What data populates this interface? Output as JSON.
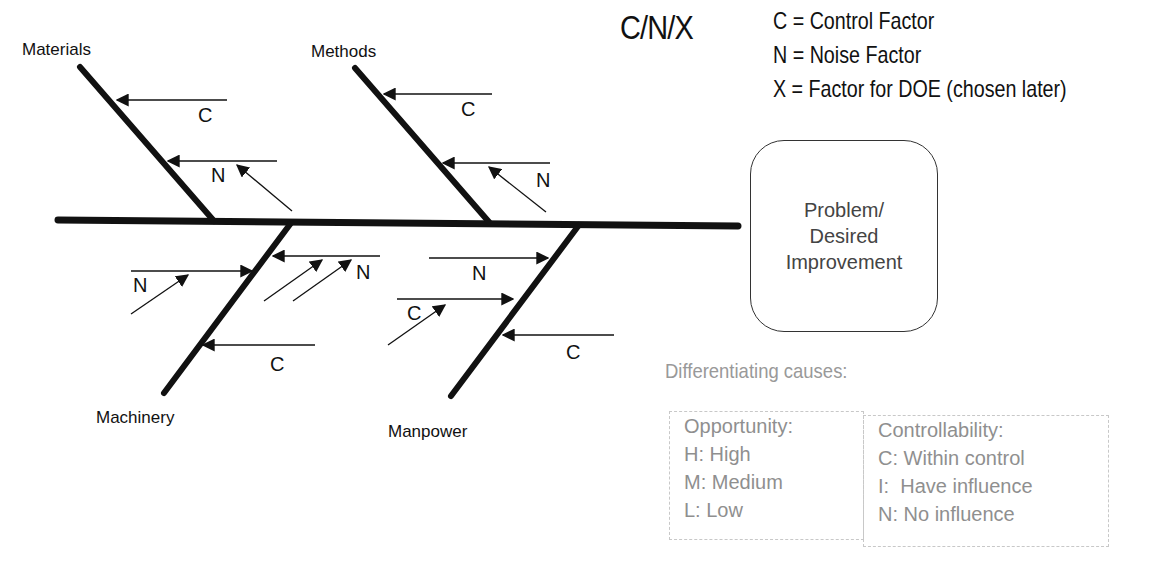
{
  "diagram": {
    "type": "fishbone",
    "title_code": "C/N/X",
    "legend": [
      "C = Control Factor",
      "N = Noise Factor",
      "X = Factor for DOE (chosen later)"
    ],
    "effect": {
      "line1": "Problem/",
      "line2": "Desired",
      "line3": "Improvement"
    },
    "categories": {
      "materials": "Materials",
      "methods": "Methods",
      "machinery": "Machinery",
      "manpower": "Manpower"
    },
    "factor_labels": {
      "materials_1": "C",
      "materials_2": "N",
      "methods_1": "C",
      "methods_2": "N",
      "machinery_1": "N",
      "machinery_2": "N",
      "machinery_3": "C",
      "manpower_1": "N",
      "manpower_2": "C",
      "manpower_3": "C"
    },
    "differentiating": {
      "title": "Differentiating causes:",
      "opportunity": {
        "heading": "Opportunity:",
        "items": [
          "H: High",
          "M: Medium",
          "L: Low"
        ]
      },
      "controllability": {
        "heading": "Controllability:",
        "items": [
          "C: Within control",
          "I:  Have influence",
          "N: No influence"
        ]
      }
    },
    "colors": {
      "line": "#111111",
      "muted_text": "#8f8f8f",
      "dashed_border": "#c8c8c8"
    }
  }
}
